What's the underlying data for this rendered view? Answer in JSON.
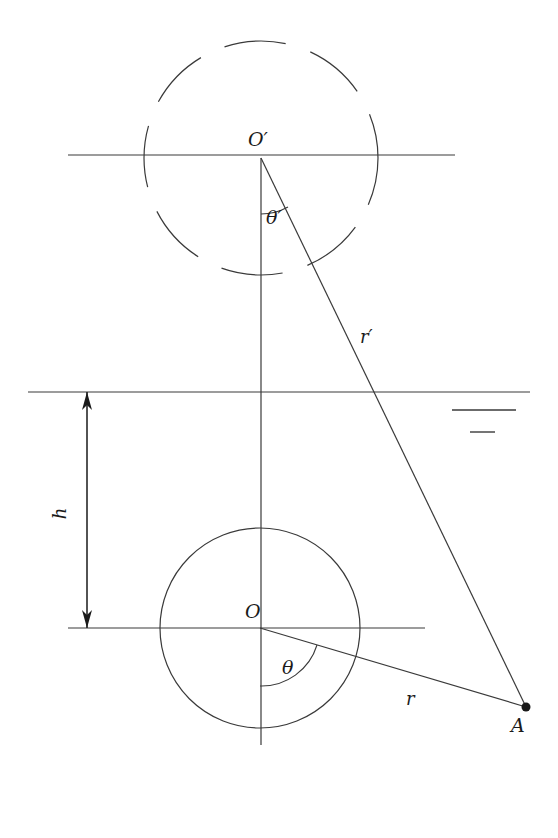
{
  "figure": {
    "type": "geometric-diagram",
    "background_color": "#ffffff",
    "stroke_color": "#3a3a3a",
    "width": 558,
    "height": 838
  },
  "labels": {
    "center_upper": "O′",
    "center_lower": "O",
    "angle_upper": "θ′",
    "angle_lower": "θ",
    "radius_upper": "r′",
    "radius_lower": "r",
    "height": "h",
    "point_a": "A"
  },
  "geometry": {
    "upper_circle": {
      "cx": 261,
      "cy": 158,
      "r": 117,
      "style": "dashed"
    },
    "lower_circle": {
      "cx": 260,
      "cy": 628,
      "r": 100,
      "style": "solid"
    },
    "horizontal_lines": [
      {
        "name": "top-horizontal-line",
        "x1": 68,
        "x2": 455,
        "y": 155
      },
      {
        "name": "middle-horizontal-line",
        "x1": 28,
        "x2": 530,
        "y": 392
      },
      {
        "name": "bottom-horizontal-line",
        "x1": 68,
        "x2": 425,
        "y": 628
      }
    ],
    "vertical_axis": {
      "x": 261,
      "y1": 158,
      "y2": 745
    },
    "point_a": {
      "x": 526,
      "y": 707
    },
    "ray_r_prime": {
      "x1": 261,
      "y1": 158,
      "x2": 526,
      "y2": 707
    },
    "ray_r": {
      "x1": 260,
      "y1": 628,
      "x2": 526,
      "y2": 707
    },
    "height_arrow": {
      "x": 87,
      "y_top": 392,
      "y_bottom": 628
    },
    "tick_marks": [
      {
        "x1": 452,
        "x2": 516,
        "y": 410
      },
      {
        "x1": 470,
        "x2": 495,
        "y": 432
      }
    ]
  },
  "label_positions": {
    "center_upper": {
      "x": 248,
      "y": 128
    },
    "center_lower": {
      "x": 245,
      "y": 600
    },
    "angle_upper": {
      "x": 266,
      "y": 206
    },
    "angle_lower": {
      "x": 282,
      "y": 656
    },
    "radius_upper": {
      "x": 360,
      "y": 326
    },
    "radius_lower": {
      "x": 406,
      "y": 688
    },
    "height": {
      "x": 54,
      "y": 503
    },
    "point_a": {
      "x": 511,
      "y": 714
    }
  }
}
